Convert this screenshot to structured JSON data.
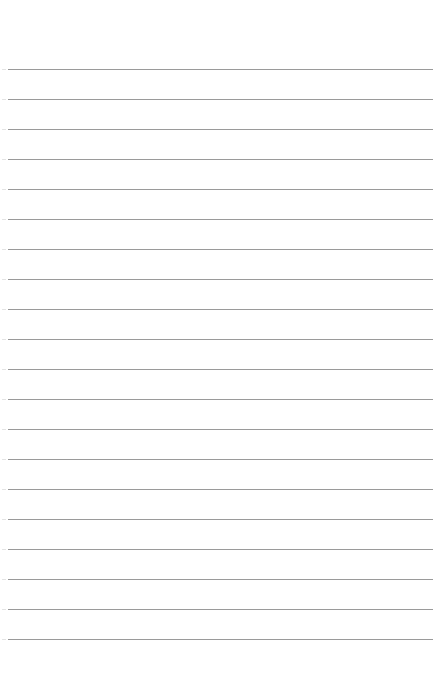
{
  "page": {
    "type": "ruled-notepad-page",
    "background_color": "#ffffff",
    "line_color": "#9a9a9a",
    "line_count": 20,
    "first_line_y": 69,
    "line_spacing": 30,
    "line_x_start": 8,
    "line_x_end": 433,
    "text": ""
  }
}
